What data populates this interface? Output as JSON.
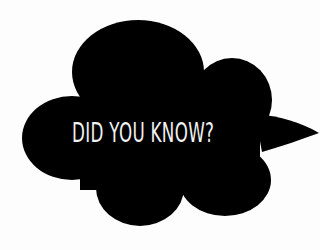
{
  "bubble": {
    "text": "DID YOU KNOW?",
    "fill_color": "#000000",
    "text_color": "#f2f2f2"
  },
  "background_color": "#fdfdfd"
}
